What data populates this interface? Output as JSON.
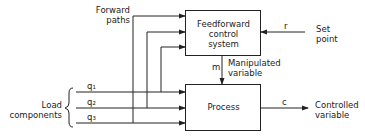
{
  "diagram": {
    "blocks": {
      "feedforward": {
        "line1": "Feedforward",
        "line2": "control",
        "line3": "system"
      },
      "process": {
        "label": "Process"
      }
    },
    "labels": {
      "forward_paths_1": "Forward",
      "forward_paths_2": "paths",
      "set_point_1": "Set",
      "set_point_2": "point",
      "r": "r",
      "m": "m",
      "manipulated_1": "Manipulated",
      "manipulated_2": "variable",
      "c": "c",
      "controlled_1": "Controlled",
      "controlled_2": "variable",
      "load_1": "Load",
      "load_2": "components",
      "q1": "q₁",
      "q2": "q₂",
      "q3": "q₃"
    },
    "colors": {
      "line": "#222222",
      "background": "#ffffff"
    }
  }
}
